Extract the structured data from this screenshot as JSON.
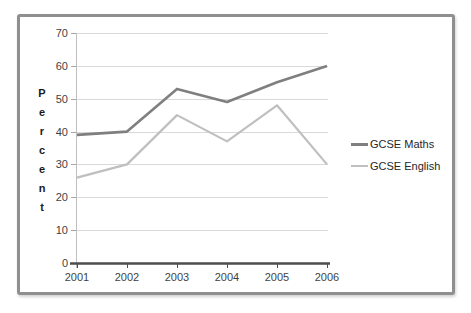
{
  "chart_data": {
    "type": "line",
    "title": "",
    "xlabel": "",
    "ylabel": "Percent",
    "categories": [
      "2001",
      "2002",
      "2003",
      "2004",
      "2005",
      "2006"
    ],
    "y_ticks": [
      0,
      10,
      20,
      30,
      40,
      50,
      60,
      70
    ],
    "ylim": [
      0,
      70
    ],
    "grid": "horizontal",
    "legend_position": "right",
    "series": [
      {
        "name": "GCSE Maths",
        "color": "#7f7f7f",
        "stroke_width": 2.6,
        "values": [
          39,
          40,
          53,
          49,
          55,
          60
        ]
      },
      {
        "name": "GCSE English",
        "color": "#bfbfbf",
        "stroke_width": 2.2,
        "values": [
          26,
          30,
          45,
          37,
          48,
          30
        ]
      }
    ],
    "colors": {
      "gridline": "#d9d9d9",
      "y_axis_line": "#bfbfbf",
      "x_axis_line": "#4d4d4d",
      "tick_mark": "#a6a6a6",
      "frame_border": "#8f8f8f",
      "tick_text": "#3f3f3f"
    }
  }
}
